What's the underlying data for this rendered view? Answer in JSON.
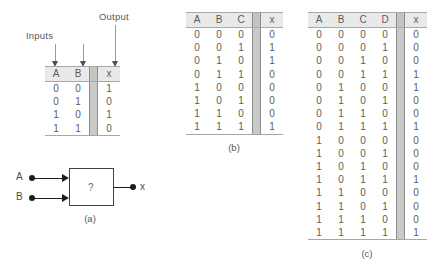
{
  "annotations": {
    "inputs_label": "Inputs",
    "output_label": "Output"
  },
  "diagram": {
    "caption": "(a)",
    "input_a_label": "A",
    "input_b_label": "B",
    "output_label": "x",
    "box_text": "?"
  },
  "table_a": {
    "caption": "",
    "headers": [
      "A",
      "B",
      "x"
    ],
    "input_headers": [
      "A",
      "B"
    ],
    "output_header": "x",
    "rows": [
      {
        "inputs": [
          "0",
          "0"
        ],
        "x": "1"
      },
      {
        "inputs": [
          "0",
          "1"
        ],
        "x": "0"
      },
      {
        "inputs": [
          "1",
          "0"
        ],
        "x": "1"
      },
      {
        "inputs": [
          "1",
          "1"
        ],
        "x": "0"
      }
    ]
  },
  "table_b": {
    "caption": "(b)",
    "input_headers": [
      "A",
      "B",
      "C"
    ],
    "output_header": "x",
    "rows": [
      {
        "inputs": [
          "0",
          "0",
          "0"
        ],
        "x": "0"
      },
      {
        "inputs": [
          "0",
          "0",
          "1"
        ],
        "x": "1"
      },
      {
        "inputs": [
          "0",
          "1",
          "0"
        ],
        "x": "1"
      },
      {
        "inputs": [
          "0",
          "1",
          "1"
        ],
        "x": "0"
      },
      {
        "inputs": [
          "1",
          "0",
          "0"
        ],
        "x": "0"
      },
      {
        "inputs": [
          "1",
          "0",
          "1"
        ],
        "x": "0"
      },
      {
        "inputs": [
          "1",
          "1",
          "0"
        ],
        "x": "0"
      },
      {
        "inputs": [
          "1",
          "1",
          "1"
        ],
        "x": "1"
      }
    ]
  },
  "table_c": {
    "caption": "(c)",
    "input_headers": [
      "A",
      "B",
      "C",
      "D"
    ],
    "output_header": "x",
    "rows": [
      {
        "inputs": [
          "0",
          "0",
          "0",
          "0"
        ],
        "x": "0"
      },
      {
        "inputs": [
          "0",
          "0",
          "0",
          "1"
        ],
        "x": "0"
      },
      {
        "inputs": [
          "0",
          "0",
          "1",
          "0"
        ],
        "x": "0"
      },
      {
        "inputs": [
          "0",
          "0",
          "1",
          "1"
        ],
        "x": "1"
      },
      {
        "inputs": [
          "0",
          "1",
          "0",
          "0"
        ],
        "x": "1"
      },
      {
        "inputs": [
          "0",
          "1",
          "0",
          "1"
        ],
        "x": "0"
      },
      {
        "inputs": [
          "0",
          "1",
          "1",
          "0"
        ],
        "x": "0"
      },
      {
        "inputs": [
          "0",
          "1",
          "1",
          "1"
        ],
        "x": "1"
      },
      {
        "inputs": [
          "1",
          "0",
          "0",
          "0"
        ],
        "x": "0"
      },
      {
        "inputs": [
          "1",
          "0",
          "0",
          "1"
        ],
        "x": "0"
      },
      {
        "inputs": [
          "1",
          "0",
          "1",
          "0"
        ],
        "x": "0"
      },
      {
        "inputs": [
          "1",
          "0",
          "1",
          "1"
        ],
        "x": "1"
      },
      {
        "inputs": [
          "1",
          "1",
          "0",
          "0"
        ],
        "x": "0"
      },
      {
        "inputs": [
          "1",
          "1",
          "0",
          "1"
        ],
        "x": "0"
      },
      {
        "inputs": [
          "1",
          "1",
          "1",
          "0"
        ],
        "x": "0"
      },
      {
        "inputs": [
          "1",
          "1",
          "1",
          "1"
        ],
        "x": "1"
      }
    ]
  },
  "colors": {
    "header_fill": "#e9e9e9",
    "separator_fill": "#c9c9c9",
    "rule": "#a8a8a8",
    "text": "#58585a",
    "wire": "#1d1d1f"
  }
}
